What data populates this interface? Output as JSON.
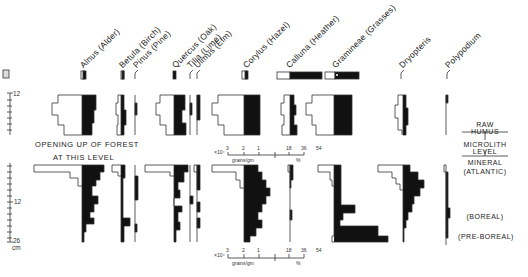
{
  "taxa": [
    {
      "name": "Alnus (Alder)"
    },
    {
      "name": "Betula (Birch)"
    },
    {
      "name": "Pinus (Pine)"
    },
    {
      "name": "Quercus (Oak)"
    },
    {
      "name": "Tilia (Lime)"
    },
    {
      "name": "Ulmus (Elm)"
    },
    {
      "name": "Corylus (Hazel)"
    },
    {
      "name": "Calluna (Heather)"
    },
    {
      "name": "Gramineae (Grasses)"
    },
    {
      "name": "Dryopteris"
    },
    {
      "name": "Polypodium"
    }
  ],
  "annotations": {
    "forest_line1": "OPENING  UP  OF  FOREST",
    "forest_line2": "AT  THIS  LEVEL"
  },
  "depth_axis": {
    "upper_tick": "12",
    "lower_tick_mid": "12",
    "lower_tick_bottom": "26",
    "unit": "cm"
  },
  "scales": {
    "upper": {
      "multiplier": "×10⁴",
      "abs_ticks": [
        "3",
        "2",
        "1"
      ],
      "abs_unit": "grains/gm",
      "pct_ticks": [
        "18",
        "36",
        "54"
      ],
      "pct_unit": "%"
    },
    "lower": {
      "multiplier": "×10⁴",
      "abs_ticks": [
        "3",
        "2",
        "1"
      ],
      "abs_unit": "grains/gm",
      "pct_ticks": [
        "18",
        "36",
        "54"
      ],
      "pct_unit": "%"
    }
  },
  "zones": {
    "raw_humus_1": "RAW",
    "raw_humus_2": "HUMUS",
    "microlith_1": "MICROLITH",
    "microlith_2": "LEVEL",
    "mineral": "MINERAL",
    "atlantic": "(ATLANTIC)",
    "boreal": "(BOREAL)",
    "pre_boreal": "(PRE-BOREAL)"
  },
  "colors": {
    "ink": "#111111",
    "outline": "#333333",
    "background": "#ffffff"
  }
}
